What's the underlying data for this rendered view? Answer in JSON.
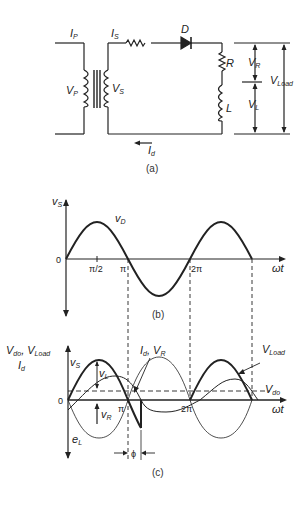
{
  "circuit": {
    "labels": {
      "ip": "I",
      "ip_sub": "P",
      "is": "I",
      "is_sub": "S",
      "diode": "D",
      "vp": "V",
      "vp_sub": "P",
      "vs": "V",
      "vs_sub": "S",
      "r": "R",
      "l": "L",
      "vr": "V",
      "vr_sub": "R",
      "vl": "V",
      "vl_sub": "L",
      "vload": "V",
      "vload_sub": "Load",
      "id": "I",
      "id_sub": "d"
    },
    "caption": "(a)"
  },
  "plot_b": {
    "ylabel": "v",
    "ylabel_sub": "S",
    "curve_label": "v",
    "curve_label_sub": "D",
    "origin": "0",
    "ticks": [
      "π/2",
      "π",
      "2π"
    ],
    "xlabel": "ωt",
    "caption": "(b)"
  },
  "plot_c": {
    "ylabel_line1": "V",
    "ylabel_line1_sub": "do",
    "ylabel_line1b": ", V",
    "ylabel_line1b_sub": "Load",
    "ylabel_line2": "I",
    "ylabel_line2_sub": "d",
    "vs": "v",
    "vs_sub": "S",
    "vl": "v",
    "vl_sub": "L",
    "vr": "v",
    "vr_sub": "R",
    "el": "e",
    "el_sub": "L",
    "id_vr": "I",
    "id_vr_sub": "d",
    "id_vr2": ", V",
    "id_vr2_sub": "R",
    "vload": "V",
    "vload_sub": "Load",
    "vdo": "V",
    "vdo_sub": "do",
    "origin": "0",
    "ticks": [
      "π",
      "2π"
    ],
    "xlabel": "ωt",
    "phi": "ϕ",
    "caption": "(c)"
  }
}
